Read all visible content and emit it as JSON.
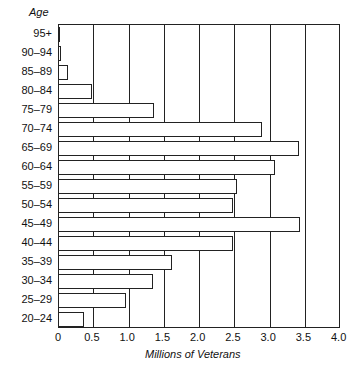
{
  "chart_data": {
    "type": "bar",
    "orientation": "horizontal",
    "title": "",
    "ylabel": "Age",
    "xlabel": "Millions of Veterans",
    "xlim": [
      0,
      4.0
    ],
    "xticks": [
      "0",
      "0.5",
      "1.0",
      "1.5",
      "2.0",
      "2.5",
      "3.0",
      "3.5",
      "4.0"
    ],
    "grid": "vertical",
    "categories": [
      "95+",
      "90–94",
      "85–89",
      "80–84",
      "75–79",
      "70–74",
      "65–69",
      "60–64",
      "55–59",
      "50–54",
      "45–49",
      "40–44",
      "35–39",
      "30–34",
      "25–29",
      "20–24"
    ],
    "values": [
      0.02,
      0.04,
      0.14,
      0.48,
      1.36,
      2.9,
      3.42,
      3.08,
      2.54,
      2.48,
      3.43,
      2.48,
      1.62,
      1.35,
      0.96,
      0.37
    ]
  }
}
